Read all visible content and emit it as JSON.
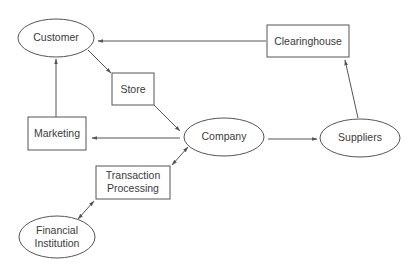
{
  "diagram": {
    "type": "flow-diagram",
    "colors": {
      "stroke": "#555555",
      "text": "#3a3a3a",
      "background": "#ffffff"
    },
    "nodes": {
      "customer": {
        "label": "Customer",
        "shape": "ellipse"
      },
      "store": {
        "label": "Store",
        "shape": "rect"
      },
      "clearinghouse": {
        "label": "Clearinghouse",
        "shape": "rect"
      },
      "marketing": {
        "label": "Marketing",
        "shape": "rect"
      },
      "company": {
        "label": "Company",
        "shape": "ellipse"
      },
      "suppliers": {
        "label": "Suppliers",
        "shape": "ellipse"
      },
      "transaction_processing": {
        "label_line1": "Transaction",
        "label_line2": "Processing",
        "shape": "rect"
      },
      "financial_institution": {
        "label_line1": "Financial",
        "label_line2": "Institution",
        "shape": "ellipse"
      }
    },
    "edges": [
      {
        "from": "Clearinghouse",
        "to": "Customer",
        "direction": "forward"
      },
      {
        "from": "Customer",
        "to": "Store",
        "direction": "forward"
      },
      {
        "from": "Store",
        "to": "Company",
        "direction": "forward"
      },
      {
        "from": "Marketing",
        "to": "Customer",
        "direction": "forward"
      },
      {
        "from": "Company",
        "to": "Marketing",
        "direction": "forward"
      },
      {
        "from": "Company",
        "to": "Suppliers",
        "direction": "forward"
      },
      {
        "from": "Suppliers",
        "to": "Clearinghouse",
        "direction": "forward"
      },
      {
        "from": "Company",
        "to": "Transaction Processing",
        "direction": "both"
      },
      {
        "from": "Transaction Processing",
        "to": "Financial Institution",
        "direction": "both"
      }
    ]
  }
}
